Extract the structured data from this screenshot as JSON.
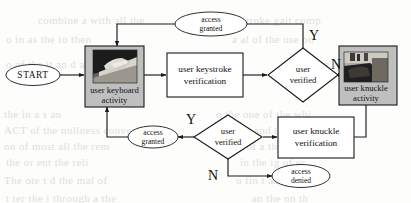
{
  "figure": {
    "type": "flowchart",
    "background_color": "#fdfdfc",
    "line_color": "#1a1a1a",
    "photo_box_fill": "#bfbfbf"
  },
  "nodes": {
    "start": {
      "label": "START",
      "shape": "ellipse"
    },
    "keyboard_activity": {
      "line1": "user keyboard",
      "line2": "activity",
      "shape": "process-with-image",
      "image": "hands-on-keyboard-photo"
    },
    "keystroke_verification": {
      "line1": "user  keystroke",
      "line2": "verification",
      "shape": "process"
    },
    "user_verified_top": {
      "line1": "user",
      "line2": "verified",
      "shape": "decision"
    },
    "knuckle_activity": {
      "line1": "user knuckle",
      "line2": "activity",
      "shape": "process-with-image",
      "image": "knuckle-hand-photo"
    },
    "knuckle_verification": {
      "line1": "user  knuckle",
      "line2": "verification",
      "shape": "process"
    },
    "user_verified_bottom": {
      "line1": "user",
      "line2": "verified",
      "shape": "decision"
    },
    "access_granted_top": {
      "line1": "access",
      "line2": "granted",
      "shape": "ellipse"
    },
    "access_granted_bottom": {
      "line1": "access",
      "line2": "granted",
      "shape": "ellipse"
    },
    "access_denied": {
      "line1": "access",
      "line2": "denied",
      "shape": "ellipse"
    }
  },
  "branch_labels": {
    "top_yes": "Y",
    "top_no": "N",
    "bottom_yes": "Y",
    "bottom_no": "N"
  },
  "background_bleed": [
    {
      "text": "combine  a  with  all  the",
      "x": 38,
      "y": 14
    },
    {
      "text": "troke  gait  comp",
      "x": 246,
      "y": 14
    },
    {
      "text": "o  in  as  the  to  then",
      "x": 6,
      "y": 33
    },
    {
      "text": "a  al  of  the  use  on",
      "x": 232,
      "y": 33
    },
    {
      "text": "o  of  the  it  an  d  al",
      "x": 6,
      "y": 58
    },
    {
      "text": "on  the  re",
      "x": 300,
      "y": 58
    },
    {
      "text": "the  in  a  s  an",
      "x": 4,
      "y": 108
    },
    {
      "text": "o  the  one  of  the  whi",
      "x": 216,
      "y": 108
    },
    {
      "text": "ACT  of  the  nullness  conven",
      "x": 4,
      "y": 124
    },
    {
      "text": "and  that  ha",
      "x": 254,
      "y": 124
    },
    {
      "text": "on  of  most  all  the  rem",
      "x": 4,
      "y": 140
    },
    {
      "text": "e  of  a  the  on  als",
      "x": 238,
      "y": 140
    },
    {
      "text": "the  or  ent  the  reli",
      "x": 6,
      "y": 156
    },
    {
      "text": "in  the  ig  of  er",
      "x": 240,
      "y": 156
    },
    {
      "text": "The  ote  t  d  the  mal  of",
      "x": 4,
      "y": 174
    },
    {
      "text": "u  fin  t  as  er  to  mi",
      "x": 236,
      "y": 174
    },
    {
      "text": "t  ter  the  i  through  a  the",
      "x": 6,
      "y": 192
    },
    {
      "text": "an  the  on  th",
      "x": 252,
      "y": 192
    }
  ]
}
